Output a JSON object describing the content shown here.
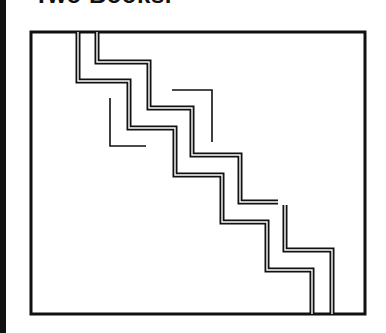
{
  "title": "Two Books.",
  "colors": {
    "ink": "#111111",
    "paper": "#ffffff"
  },
  "diagram": {
    "frame": {
      "x": 31,
      "y": 32,
      "width": 334,
      "height": 282
    },
    "paths": [
      {
        "name": "outer-staircase-line",
        "points": "78,32 78,81 129,81 129,128 175,128 175,175 222,175 222,222 267,222 267,270 312,270 312,314"
      },
      {
        "name": "inner-staircase-line",
        "points": "97,32 97,62 149,62 149,108 192,108 192,155 240,155 240,202 278,202"
      },
      {
        "name": "lower-right-line",
        "points": "285,205 285,250 332,250 332,314"
      }
    ],
    "brackets": [
      {
        "name": "left-bracket",
        "points": "110,98 110,146 146,146"
      },
      {
        "name": "right-bracket",
        "points": "172,90 212,90 212,142"
      }
    ]
  }
}
